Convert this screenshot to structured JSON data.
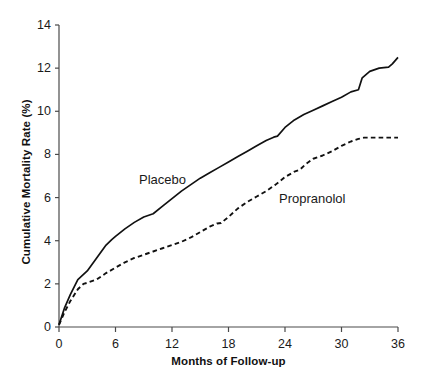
{
  "chart_data": {
    "type": "line",
    "title": "",
    "subtitle": "",
    "xlabel": "Months of Follow-up",
    "ylabel": "Cumulative Mortality Rate (%)",
    "xlim": [
      0,
      36
    ],
    "ylim": [
      0,
      14
    ],
    "xticks": [
      0,
      6,
      12,
      18,
      24,
      30,
      36
    ],
    "yticks": [
      0,
      2,
      4,
      6,
      8,
      10,
      12,
      14
    ],
    "xtick_labels": [
      "0",
      "6",
      "12",
      "18",
      "24",
      "30",
      "36"
    ],
    "ytick_labels": [
      "0",
      "2",
      "4",
      "6",
      "8",
      "10",
      "12",
      "14"
    ],
    "grid": false,
    "legend_position": "inline-annotation",
    "annotations": [
      {
        "text": "Placebo",
        "x": 8.5,
        "y": 7.0
      },
      {
        "text": "Propranolol",
        "x": 23.4,
        "y": 6.3
      }
    ],
    "series": [
      {
        "name": "Placebo",
        "style": "solid",
        "color": "#111111",
        "x": [
          0,
          0.6,
          1.2,
          2.0,
          3.0,
          4.0,
          5.0,
          5.6,
          6.0,
          7.0,
          8.0,
          9.0,
          10.0,
          11.0,
          12.0,
          13.0,
          14.0,
          15.0,
          16.0,
          17.0,
          18.0,
          19.0,
          20.0,
          21.0,
          22.0,
          22.8,
          23.2,
          24.0,
          25.0,
          26.0,
          27.0,
          28.0,
          29.0,
          30.0,
          31.0,
          31.8,
          32.2,
          33.0,
          34.0,
          35.0,
          35.4,
          36.0
        ],
        "y": [
          0.1,
          0.9,
          1.5,
          2.2,
          2.6,
          3.2,
          3.8,
          4.05,
          4.2,
          4.55,
          4.85,
          5.1,
          5.25,
          5.6,
          5.95,
          6.3,
          6.6,
          6.9,
          7.15,
          7.4,
          7.65,
          7.9,
          8.15,
          8.4,
          8.65,
          8.8,
          8.85,
          9.25,
          9.6,
          9.85,
          10.05,
          10.25,
          10.45,
          10.65,
          10.9,
          11.0,
          11.55,
          11.85,
          12.0,
          12.05,
          12.2,
          12.5
        ]
      },
      {
        "name": "Propranolol",
        "style": "dashed",
        "color": "#111111",
        "x": [
          0,
          0.6,
          1.2,
          2.0,
          2.6,
          3.0,
          4.0,
          5.0,
          6.0,
          7.0,
          8.0,
          9.0,
          10.0,
          11.0,
          12.0,
          13.0,
          14.0,
          15.0,
          16.0,
          16.8,
          17.2,
          18.0,
          19.0,
          20.0,
          21.0,
          22.0,
          23.0,
          24.0,
          25.0,
          25.6,
          26.2,
          27.0,
          28.0,
          29.0,
          30.0,
          31.0,
          31.8,
          32.4,
          33.0,
          34.0,
          35.0,
          36.0
        ],
        "y": [
          0.1,
          0.7,
          1.2,
          1.75,
          2.0,
          2.05,
          2.2,
          2.5,
          2.75,
          3.0,
          3.2,
          3.35,
          3.5,
          3.65,
          3.8,
          3.95,
          4.15,
          4.4,
          4.65,
          4.8,
          4.82,
          5.1,
          5.5,
          5.8,
          6.05,
          6.3,
          6.6,
          6.95,
          7.2,
          7.3,
          7.55,
          7.8,
          7.95,
          8.15,
          8.4,
          8.6,
          8.72,
          8.78,
          8.78,
          8.78,
          8.78,
          8.78
        ]
      }
    ]
  },
  "axes": {
    "y_title": "Cumulative Mortality Rate (%)",
    "x_title": "Months of Follow-up",
    "y_ticks": [
      {
        "label": "14"
      },
      {
        "label": "12"
      },
      {
        "label": "10"
      },
      {
        "label": "8"
      },
      {
        "label": "6"
      },
      {
        "label": "4"
      },
      {
        "label": "2"
      },
      {
        "label": "0"
      }
    ],
    "x_ticks": [
      {
        "label": "0"
      },
      {
        "label": "6"
      },
      {
        "label": "12"
      },
      {
        "label": "18"
      },
      {
        "label": "24"
      },
      {
        "label": "30"
      },
      {
        "label": "36"
      }
    ]
  },
  "labels": {
    "placebo": "Placebo",
    "propranolol": "Propranolol"
  },
  "colors": {
    "axis": "#4a4a4a",
    "line": "#111111",
    "background": "#ffffff",
    "text": "#1a1a1a"
  }
}
